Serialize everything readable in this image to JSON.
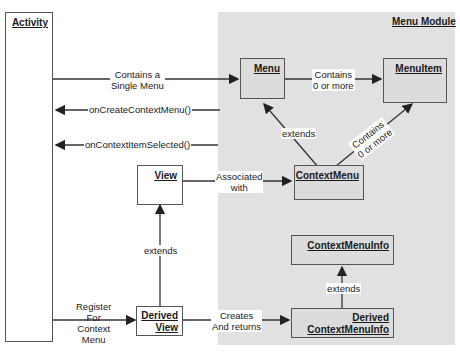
{
  "module": {
    "title": "Menu Module",
    "background": "#e1e1e1"
  },
  "boxes": {
    "activity": "Activity",
    "menu": "Menu",
    "menuitem": "MenuItem",
    "view": "View",
    "contextmenu": "ContextMenu",
    "contextmenuinfo": "ContextMenuInfo",
    "derived_view_1": "Derived",
    "derived_view_2": "View",
    "derived_cmi_1": "Derived",
    "derived_cmi_2": "ContextMenuInfo"
  },
  "edges": {
    "contains_single_1": "Contains a",
    "contains_single_2": "Single Menu",
    "on_create": "onCreateContextMenu()",
    "on_selected": "onContextItemSelected()",
    "contains_more_1": "Contains",
    "contains_more_2": "0 or more",
    "extends_menu": "extends",
    "contains_diag_1": "Contains",
    "contains_diag_2": "0 or more",
    "associated_1": "Associated",
    "associated_2": "with",
    "extends_view": "extends",
    "extends_cmi": "extends",
    "register_1": "Register",
    "register_2": "For",
    "register_3": "Context",
    "register_4": "Menu",
    "creates_1": "Creates",
    "creates_2": "And returns"
  }
}
